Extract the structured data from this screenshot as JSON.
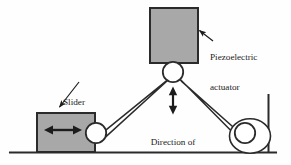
{
  "figure": {
    "type": "mechanism-schematic",
    "background_color": "#fefefe",
    "stroke_color": "#2b2b2b",
    "block_fill_color": "#a8a8a8",
    "joint_fill_color": "#ffffff"
  },
  "labels": {
    "actuator": {
      "line1": "Piezoelectric",
      "line2": "actuator"
    },
    "slider": {
      "line1": "Slider"
    },
    "direction": {
      "line1": "Direction of",
      "line2": "motion"
    }
  },
  "components": {
    "actuator_block": {
      "name": "Piezoelectric actuator",
      "x": 150,
      "y": 8,
      "width": 48,
      "height": 55,
      "fill": "#a8a8a8"
    },
    "slider_block": {
      "name": "Slider",
      "x": 37,
      "y": 113,
      "width": 58,
      "height": 39,
      "fill": "#a8a8a8"
    },
    "top_joint": {
      "name": "Top pivot joint",
      "cx": 173,
      "cy": 72,
      "r": 10
    },
    "slider_joint": {
      "name": "Slider pivot joint",
      "cx": 96,
      "cy": 133,
      "r": 10
    },
    "wheel_outer": {
      "name": "Cam wheel",
      "cx": 250,
      "cy": 136,
      "rx": 20,
      "ry": 17
    },
    "wheel_inner": {
      "name": "Wheel pivot joint",
      "cx": 245,
      "cy": 133,
      "r": 10
    },
    "ground": {
      "name": "Ground surface",
      "x1": 10,
      "y1": 152,
      "x2": 276,
      "y2": 152
    },
    "wall": {
      "name": "Vertical wall",
      "x1": 268,
      "y1": 95,
      "x2": 268,
      "y2": 152
    },
    "left_link": {
      "name": "Left linkage bar",
      "from": "top_joint",
      "to": "slider_joint"
    },
    "right_link": {
      "name": "Right linkage bar",
      "from": "top_joint",
      "to": "wheel_inner"
    },
    "motion_arrow_vertical": {
      "name": "Direction of motion arrow",
      "x": 173,
      "y_top": 87,
      "y_bottom": 114,
      "double_headed": true
    },
    "motion_arrow_horizontal": {
      "name": "Slider travel arrow",
      "y": 130,
      "x_left": 45,
      "x_right": 81,
      "double_headed": true
    },
    "leader_actuator": {
      "name": "Actuator leader arrow",
      "from_x": 213,
      "from_y": 41,
      "to_x": 196,
      "to_y": 28
    },
    "leader_slider": {
      "name": "Slider leader arrow",
      "from_x": 79,
      "from_y": 82,
      "to_x": 57,
      "to_y": 110
    }
  }
}
